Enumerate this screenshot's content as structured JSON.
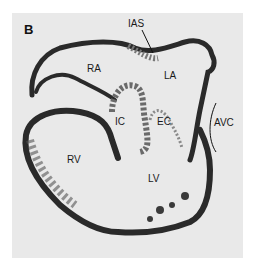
{
  "figure": {
    "panel_letter": "B",
    "labels": {
      "ias": "IAS",
      "ra": "RA",
      "la": "LA",
      "ic": "IC",
      "ec": "EC",
      "avc": "AVC",
      "rv": "RV",
      "lv": "LV"
    },
    "colors": {
      "background": "#e9e9e9",
      "tissue_dark": "#2a2a2a",
      "tissue_mid": "#7a7a7a",
      "lumen": "#ececec"
    }
  }
}
